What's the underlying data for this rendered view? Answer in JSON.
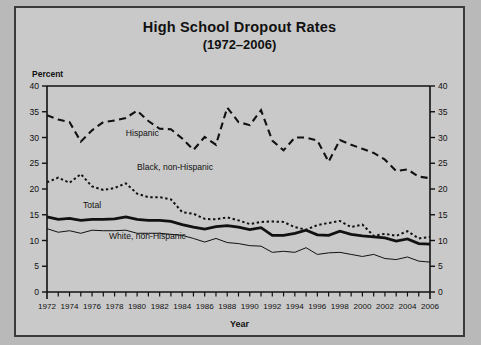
{
  "chart_data": {
    "type": "line",
    "title": "High School Dropout Rates",
    "subtitle": "(1972–2006)",
    "xlabel": "Year",
    "ylabel": "Percent",
    "ylim": [
      0,
      40
    ],
    "ytick_step": 5,
    "yticks": [
      0,
      5,
      10,
      15,
      20,
      25,
      30,
      35,
      40
    ],
    "xlim": [
      1972,
      2006
    ],
    "xticks": [
      1972,
      1974,
      1976,
      1978,
      1980,
      1982,
      1984,
      1986,
      1988,
      1990,
      1992,
      1994,
      1996,
      1998,
      2000,
      2002,
      2004,
      2006
    ],
    "xtick_minor_step": 1,
    "grid": false,
    "legend_position": "inline-labels",
    "dual_y_axis": true,
    "x": [
      1972,
      1973,
      1974,
      1975,
      1976,
      1977,
      1978,
      1979,
      1980,
      1981,
      1982,
      1983,
      1984,
      1985,
      1986,
      1987,
      1988,
      1989,
      1990,
      1991,
      1992,
      1993,
      1994,
      1995,
      1996,
      1997,
      1998,
      1999,
      2000,
      2001,
      2002,
      2003,
      2004,
      2005,
      2006
    ],
    "series": [
      {
        "name": "Hispanic",
        "style": "long-dash",
        "color": "#111111",
        "label_x": 1979,
        "label_y": 30.2,
        "values": [
          34.3,
          33.5,
          33.0,
          29.2,
          31.4,
          33.0,
          33.3,
          33.8,
          35.2,
          33.2,
          31.7,
          31.6,
          29.8,
          27.6,
          30.1,
          28.6,
          35.8,
          33.0,
          32.4,
          35.3,
          29.4,
          27.5,
          30.0,
          30.0,
          29.4,
          25.3,
          29.5,
          28.6,
          27.8,
          27.0,
          25.7,
          23.5,
          23.8,
          22.4,
          22.1
        ]
      },
      {
        "name": "Black, non-Hispanic",
        "style": "dotted",
        "color": "#111111",
        "label_x": 1980,
        "label_y": 23.6,
        "values": [
          21.3,
          22.2,
          21.2,
          22.9,
          20.5,
          19.8,
          20.2,
          21.1,
          19.1,
          18.4,
          18.4,
          18.0,
          15.5,
          15.2,
          14.2,
          14.1,
          14.5,
          13.9,
          13.2,
          13.6,
          13.7,
          13.6,
          12.6,
          12.1,
          13.0,
          13.4,
          13.8,
          12.6,
          13.1,
          10.9,
          11.3,
          10.9,
          11.8,
          10.4,
          10.7
        ]
      },
      {
        "name": "Total",
        "style": "thick-solid",
        "color": "#111111",
        "label_x": 1975.2,
        "label_y": 16.4,
        "values": [
          14.6,
          14.1,
          14.3,
          13.9,
          14.1,
          14.1,
          14.2,
          14.6,
          14.1,
          13.9,
          13.9,
          13.7,
          13.1,
          12.6,
          12.2,
          12.7,
          12.9,
          12.6,
          12.1,
          12.5,
          11.0,
          11.0,
          11.4,
          12.0,
          11.1,
          11.0,
          11.8,
          11.2,
          10.9,
          10.7,
          10.5,
          9.9,
          10.3,
          9.4,
          9.3
        ]
      },
      {
        "name": "White, non-Hispanic",
        "style": "thin-solid",
        "color": "#111111",
        "label_x": 1977.5,
        "label_y": 10.3,
        "values": [
          12.3,
          11.6,
          11.9,
          11.4,
          12.0,
          11.9,
          11.9,
          12.0,
          11.4,
          11.4,
          11.4,
          11.2,
          11.0,
          10.4,
          9.7,
          10.4,
          9.6,
          9.4,
          9.0,
          8.9,
          7.7,
          7.9,
          7.7,
          8.6,
          7.3,
          7.6,
          7.7,
          7.3,
          6.9,
          7.3,
          6.5,
          6.3,
          6.8,
          6.0,
          5.8
        ]
      }
    ]
  }
}
